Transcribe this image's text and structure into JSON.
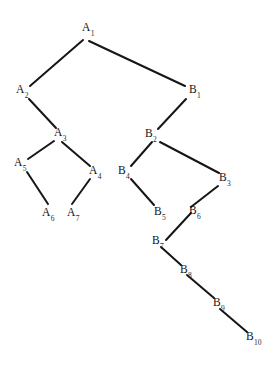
{
  "diagram": {
    "background_color": "#ffffff",
    "edge_color": "#161616",
    "label_color": "#111111",
    "edge_width": 2,
    "width": 277,
    "height": 374,
    "nodes": [
      {
        "id": "A1",
        "base": "A",
        "sub": "1",
        "label": "A1",
        "label_x": 82,
        "label_y": 22,
        "vx": 84,
        "vy": 40
      },
      {
        "id": "A2",
        "base": "A",
        "sub": "2",
        "label": "A2",
        "label_x": 16,
        "label_y": 84,
        "vx": 29,
        "vy": 97
      },
      {
        "id": "A3",
        "base": "A",
        "sub": "3",
        "label": "A3",
        "label_x": 54,
        "label_y": 127,
        "vx": 56,
        "vy": 140
      },
      {
        "id": "A4",
        "base": "A",
        "sub": "4",
        "label": "A4",
        "label_x": 89,
        "label_y": 165,
        "vx": 90,
        "vy": 178
      },
      {
        "id": "A5",
        "base": "A",
        "sub": "5",
        "label": "A5",
        "label_x": 14,
        "label_y": 157,
        "vx": 27,
        "vy": 171
      },
      {
        "id": "A6",
        "base": "A",
        "sub": "6",
        "label": "A6",
        "label_x": 42,
        "label_y": 207,
        "vx": 47,
        "vy": 205
      },
      {
        "id": "A7",
        "base": "A",
        "sub": "7",
        "label": "A7",
        "label_x": 67,
        "label_y": 207,
        "vx": 72,
        "vy": 205
      },
      {
        "id": "B1",
        "base": "B",
        "sub": "1",
        "label": "B1",
        "label_x": 189,
        "label_y": 84,
        "vx": 186,
        "vy": 97
      },
      {
        "id": "B2",
        "base": "B",
        "sub": "2",
        "label": "B2",
        "label_x": 145,
        "label_y": 128,
        "vx": 157,
        "vy": 141
      },
      {
        "id": "B3",
        "base": "B",
        "sub": "3",
        "label": "B3",
        "label_x": 219,
        "label_y": 172,
        "vx": 219,
        "vy": 185
      },
      {
        "id": "B4",
        "base": "B",
        "sub": "4",
        "label": "B4",
        "label_x": 118,
        "label_y": 165,
        "vx": 131,
        "vy": 178
      },
      {
        "id": "B5",
        "base": "B",
        "sub": "5",
        "label": "B5",
        "label_x": 154,
        "label_y": 206,
        "vx": 153,
        "vy": 205
      },
      {
        "id": "B6",
        "base": "B",
        "sub": "6",
        "label": "B6",
        "label_x": 189,
        "label_y": 205,
        "vx": 190,
        "vy": 208
      },
      {
        "id": "B7",
        "base": "B",
        "sub": "7",
        "label": "B7",
        "label_x": 152,
        "label_y": 235,
        "vx": 166,
        "vy": 246
      },
      {
        "id": "B8",
        "base": "B",
        "sub": "8",
        "label": "B8",
        "label_x": 180,
        "label_y": 264,
        "vx": 180,
        "vy": 266
      },
      {
        "id": "B9",
        "base": "B",
        "sub": "9",
        "label": "B9",
        "label_x": 213,
        "label_y": 297,
        "vx": 213,
        "vy": 299
      },
      {
        "id": "B10",
        "base": "B",
        "sub": "10",
        "label": "B10",
        "label_x": 246,
        "label_y": 331,
        "vx": 246,
        "vy": 333
      }
    ],
    "edges": [
      {
        "id": "A1-A2",
        "from": "A1",
        "to": "A2",
        "x1": 83,
        "y1": 40,
        "x2": 30,
        "y2": 86
      },
      {
        "id": "A1-B1",
        "from": "A1",
        "to": "B1",
        "x1": 89,
        "y1": 41,
        "x2": 185,
        "y2": 86
      },
      {
        "id": "A2-A3",
        "from": "A2",
        "to": "A3",
        "x1": 29,
        "y1": 99,
        "x2": 56,
        "y2": 128
      },
      {
        "id": "A3-A5",
        "from": "A3",
        "to": "A5",
        "x1": 54,
        "y1": 141,
        "x2": 28,
        "y2": 159
      },
      {
        "id": "A3-A4",
        "from": "A3",
        "to": "A4",
        "x1": 62,
        "y1": 142,
        "x2": 90,
        "y2": 166
      },
      {
        "id": "A5-A6",
        "from": "A5",
        "to": "A6",
        "x1": 27,
        "y1": 172,
        "x2": 48,
        "y2": 204
      },
      {
        "id": "A4-A7",
        "from": "A4",
        "to": "A7",
        "x1": 90,
        "y1": 179,
        "x2": 72,
        "y2": 204
      },
      {
        "id": "B1-B2",
        "from": "B1",
        "to": "B2",
        "x1": 186,
        "y1": 99,
        "x2": 158,
        "y2": 129
      },
      {
        "id": "B2-B4",
        "from": "B2",
        "to": "B4",
        "x1": 152,
        "y1": 142,
        "x2": 131,
        "y2": 166
      },
      {
        "id": "B2-B3",
        "from": "B2",
        "to": "B3",
        "x1": 160,
        "y1": 142,
        "x2": 219,
        "y2": 173
      },
      {
        "id": "B4-B5",
        "from": "B4",
        "to": "B5",
        "x1": 131,
        "y1": 179,
        "x2": 154,
        "y2": 205
      },
      {
        "id": "B3-B6",
        "from": "B3",
        "to": "B6",
        "x1": 218,
        "y1": 186,
        "x2": 191,
        "y2": 207
      },
      {
        "id": "B6-B7",
        "from": "B6",
        "to": "B7",
        "x1": 191,
        "y1": 213,
        "x2": 166,
        "y2": 240
      },
      {
        "id": "B7-B8",
        "from": "B7",
        "to": "B8",
        "x1": 161,
        "y1": 247,
        "x2": 181,
        "y2": 265
      },
      {
        "id": "B8-B9",
        "from": "B8",
        "to": "B9",
        "x1": 187,
        "y1": 275,
        "x2": 214,
        "y2": 298
      },
      {
        "id": "B9-B10",
        "from": "B9",
        "to": "B10",
        "x1": 220,
        "y1": 309,
        "x2": 247,
        "y2": 332
      }
    ]
  }
}
